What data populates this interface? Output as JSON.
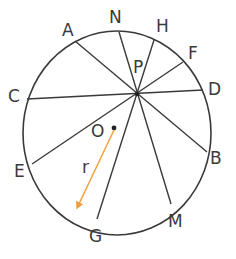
{
  "diagram": {
    "circle": {
      "cx": 117,
      "cy": 133,
      "rx": 94,
      "ry": 102,
      "stroke": "#3a3a3a"
    },
    "center": {
      "label": "O",
      "x": 114,
      "y": 128
    },
    "intersection": {
      "label": "P",
      "x": 137,
      "y": 94
    },
    "radius": {
      "label": "r",
      "color": "#f0a040"
    },
    "points": [
      {
        "label": "A",
        "x": 75,
        "y": 41
      },
      {
        "label": "N",
        "x": 119,
        "y": 32
      },
      {
        "label": "H",
        "x": 154,
        "y": 40
      },
      {
        "label": "F",
        "x": 183,
        "y": 62
      },
      {
        "label": "D",
        "x": 203,
        "y": 90
      },
      {
        "label": "C",
        "x": 27,
        "y": 99
      },
      {
        "label": "E",
        "x": 32,
        "y": 164
      },
      {
        "label": "G",
        "x": 97,
        "y": 219
      },
      {
        "label": "M",
        "x": 171,
        "y": 204
      },
      {
        "label": "B",
        "x": 207,
        "y": 152
      }
    ],
    "chords": [
      [
        "A",
        "B"
      ],
      [
        "N",
        "M"
      ],
      [
        "H",
        "G"
      ],
      [
        "F",
        "E"
      ],
      [
        "D",
        "C"
      ]
    ]
  }
}
